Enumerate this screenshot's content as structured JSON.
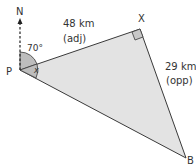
{
  "diagram": {
    "points": {
      "P": {
        "label": "P",
        "x": 20,
        "y": 70
      },
      "X": {
        "label": "X",
        "x": 140,
        "y": 29
      },
      "B": {
        "label": "B",
        "x": 186,
        "y": 158
      }
    },
    "north_label": "N",
    "angle_bearing": "70°",
    "angle_unknown": "x",
    "side_px": {
      "value": "48 km",
      "note": "(adj)"
    },
    "side_xb": {
      "value": "29 km",
      "note": "(opp)"
    },
    "colors": {
      "fill": "#e3e3e3",
      "line": "#3a3a3a",
      "angle_fill": "#bdbdbd"
    }
  }
}
